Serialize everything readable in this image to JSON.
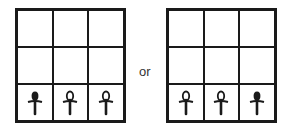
{
  "connector_label": "or",
  "colors": {
    "line": "#1a1a1a",
    "background": "#ffffff"
  },
  "grids": [
    {
      "name": "left-grid",
      "rows": 3,
      "cols": 3,
      "bottom_row": [
        "ankh-filled",
        "ankh-open",
        "ankh-open"
      ]
    },
    {
      "name": "right-grid",
      "rows": 3,
      "cols": 3,
      "bottom_row": [
        "ankh-open",
        "ankh-open",
        "ankh-filled"
      ]
    }
  ]
}
